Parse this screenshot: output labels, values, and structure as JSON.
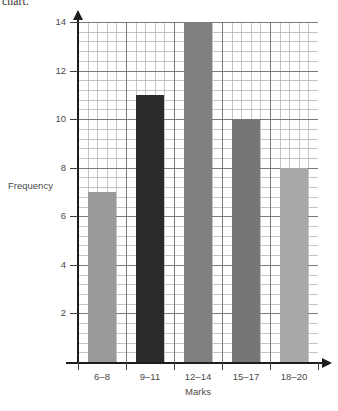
{
  "caption": {
    "fragment_text": "chart."
  },
  "chart_data": {
    "type": "bar",
    "title": "",
    "xlabel": "Marks",
    "ylabel": "Frequency",
    "categories": [
      "6–8",
      "9–11",
      "12–14",
      "15–17",
      "18–20"
    ],
    "values": [
      7,
      11,
      14,
      10,
      8
    ],
    "series": [
      {
        "name": "Frequency",
        "values": [
          7,
          11,
          14,
          10,
          8
        ]
      }
    ],
    "ylim": [
      0,
      14
    ],
    "ytick_labels": [
      "2",
      "4",
      "6",
      "8",
      "10",
      "12",
      "14"
    ],
    "ytick_values": [
      2,
      4,
      6,
      8,
      10,
      12,
      14
    ],
    "ystep": 2,
    "grid": true,
    "grid_minor": true,
    "minor_divisions_per_major": 5,
    "legend": "none",
    "bar_colors": [
      "#9a9a9a",
      "#2b2b2b",
      "#808080",
      "#767676",
      "#a8a8a8"
    ],
    "axis_color": "#1d1d1d",
    "grid_major_color": "#6e6e6e",
    "grid_minor_color": "#b2b2b2",
    "x_axis_arrow": true,
    "y_axis_arrow": true
  }
}
